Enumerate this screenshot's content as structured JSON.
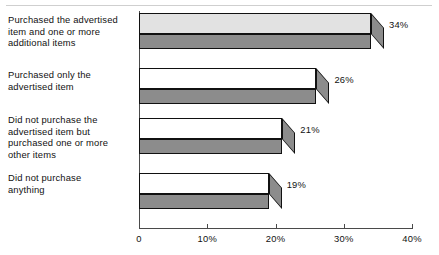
{
  "chart_data": {
    "type": "bar",
    "orientation": "horizontal",
    "title": "",
    "xlabel": "",
    "ylabel": "",
    "xlim": [
      0,
      40
    ],
    "grid": false,
    "legend": null,
    "categories": [
      "Purchased the advertised item and one or more additional items",
      "Purchased only the advertised item",
      "Did not purchase the advertised item but purchased one or more other items",
      "Did not purchase anything"
    ],
    "values": [
      34,
      26,
      21,
      19
    ],
    "value_labels": [
      "34%",
      "26%",
      "21%",
      "19%"
    ],
    "tick_labels": [
      "0",
      "10%",
      "20%",
      "30%",
      "40%"
    ],
    "tick_values": [
      0,
      10,
      20,
      30,
      40
    ]
  },
  "categories_wrapped": [
    [
      "Purchased the advertised",
      "item and one or more",
      "additional items"
    ],
    [
      "Purchased only the",
      "advertised item"
    ],
    [
      "Did not purchase the",
      "advertised item but",
      "purchased one or more",
      "other items"
    ],
    [
      "Did not purchase",
      "anything"
    ]
  ],
  "colors": {
    "bar_top_first": "#e2e2e2",
    "bar_top_rest": "#ffffff",
    "bar_front": "#8c8c8c",
    "bar_outline": "#111111",
    "axis": "#4a4a4a",
    "text": "#111111",
    "background": "#ffffff",
    "top_rule": "#cfcfcf"
  }
}
